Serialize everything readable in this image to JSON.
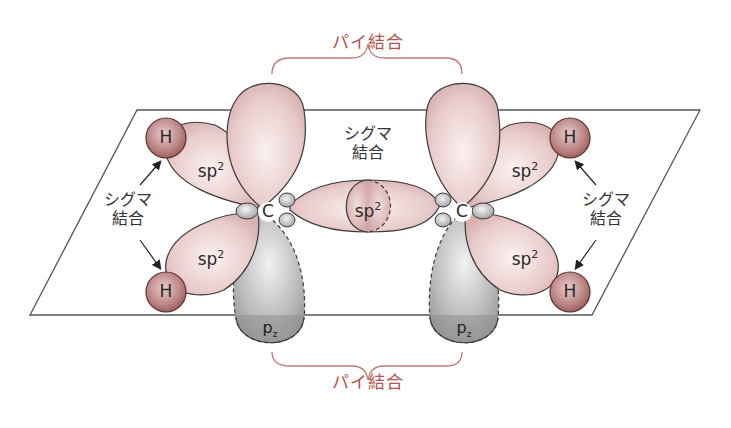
{
  "diagram": {
    "title_top": "パイ結合",
    "title_bottom": "パイ結合",
    "sigma_center": [
      "シグマ",
      "結合"
    ],
    "sigma_left": [
      "シグマ",
      "結合"
    ],
    "sigma_right": [
      "シグマ",
      "結合"
    ],
    "orbitals": {
      "sp2_label": "sp",
      "sp2_sup": "2",
      "pz_label": "p",
      "pz_sub": "z"
    },
    "atoms": {
      "carbon": "C",
      "hydrogen": "H"
    },
    "colors": {
      "pi_label": "#b5524f",
      "sp2_lobe": "#e8c8c8",
      "hydrogen": "#b87a7a",
      "pz_lobe": "#a8a8a8",
      "outline": "#3a3a3a"
    }
  }
}
